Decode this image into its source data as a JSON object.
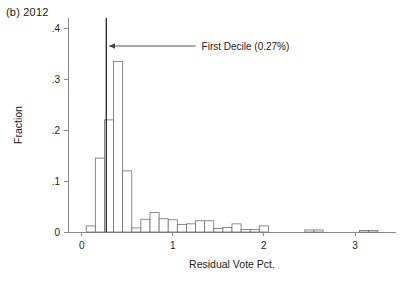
{
  "panel": {
    "label": "(b) 2012"
  },
  "chart_data": {
    "type": "bar",
    "title": "(b) 2012",
    "xlabel": "Residual Vote Pct.",
    "ylabel": "Fraction",
    "xlim": [
      -0.15,
      3.45
    ],
    "ylim": [
      0,
      0.42
    ],
    "xticks": [
      0,
      1,
      2,
      3
    ],
    "xtick_labels": [
      "0",
      "1",
      "2",
      "3"
    ],
    "yticks": [
      0,
      0.1,
      0.2,
      0.3,
      0.4
    ],
    "ytick_labels": [
      "0",
      ".1",
      ".2",
      ".3",
      ".4"
    ],
    "grid": false,
    "legend": false,
    "bin_width": 0.1,
    "bin_starts": [
      0.05,
      0.15,
      0.25,
      0.35,
      0.45,
      0.55,
      0.65,
      0.75,
      0.85,
      0.95,
      1.05,
      1.15,
      1.25,
      1.35,
      1.45,
      1.55,
      1.65,
      1.75,
      1.85,
      1.95,
      2.45,
      2.55,
      3.05,
      3.15
    ],
    "values": [
      0.012,
      0.145,
      0.22,
      0.335,
      0.12,
      0.008,
      0.025,
      0.038,
      0.026,
      0.024,
      0.015,
      0.016,
      0.022,
      0.022,
      0.007,
      0.009,
      0.016,
      0.005,
      0.005,
      0.012,
      0.004,
      0.004,
      0.003,
      0.003
    ],
    "annotations": [
      {
        "name": "first-decile",
        "text": "First Decile (0.27%)",
        "x": 0.27,
        "arrow_from_x": 1.25,
        "arrow_to_x": 0.3,
        "arrow_y": 0.365
      }
    ]
  }
}
